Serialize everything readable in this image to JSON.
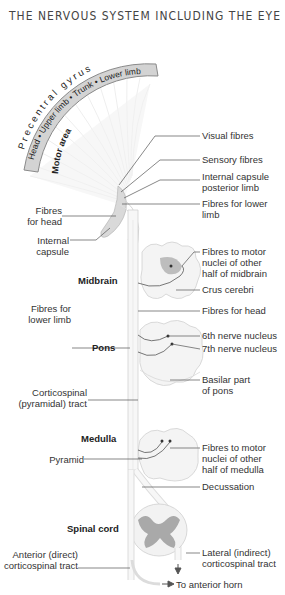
{
  "title": "THE NERVOUS SYSTEM INCLUDING THE EYE",
  "gyrus": {
    "label": "Precentral gyrus",
    "band": "Head • Upper limb • Trunk • Lower limb",
    "area": "Motor area"
  },
  "labels": {
    "visual_fibres": "Visual fibres",
    "sensory_fibres": "Sensory fibres",
    "internal_capsule_posterior_1": "Internal capsule",
    "internal_capsule_posterior_2": "posterior limb",
    "fibres_lower_limb_1": "Fibres for lower",
    "fibres_lower_limb_2": "limb",
    "fibres_head_1": "Fibres",
    "fibres_head_2": "for head",
    "internal_capsule_1": "Internal",
    "internal_capsule_2": "capsule",
    "midbrain": "Midbrain",
    "motor_nuclei_midbrain_1": "Fibres to motor",
    "motor_nuclei_midbrain_2": "nuclei of other",
    "motor_nuclei_midbrain_3": "half of midbrain",
    "crus_cerebri": "Crus cerebri",
    "fibres_lower_limb_b1": "Fibres for",
    "fibres_lower_limb_b2": "lower limb",
    "fibres_for_head": "Fibres for head",
    "sixth_nerve": "6th nerve nucleus",
    "seventh_nerve": "7th nerve nucleus",
    "pons": "Pons",
    "basilar_1": "Basilar part",
    "basilar_2": "of pons",
    "corticospinal_1": "Corticospinal",
    "corticospinal_2": "(pyramidal) tract",
    "medulla": "Medulla",
    "motor_nuclei_medulla_1": "Fibres to motor",
    "motor_nuclei_medulla_2": "nuclei of other",
    "motor_nuclei_medulla_3": "half of medulla",
    "pyramid": "Pyramid",
    "decussation": "Decussation",
    "spinal_cord": "Spinal cord",
    "anterior_1": "Anterior (direct)",
    "anterior_2": "corticospinal tract",
    "lateral_1": "Lateral (indirect)",
    "lateral_2": "corticospinal tract",
    "anterior_horn": "To anterior horn"
  },
  "colors": {
    "band_fill": "#d3d3d3",
    "band_stroke": "#8a8a8a",
    "structure_fill": "#f4f4f4",
    "structure_stroke": "#cfcfcf",
    "grey_matter": "#a9a9a9",
    "leader": "#555555"
  }
}
